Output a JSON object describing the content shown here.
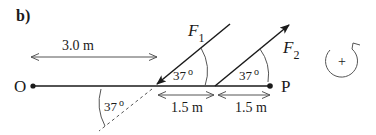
{
  "part_label": "b)",
  "points": {
    "origin": "O",
    "pivot": "P"
  },
  "forces": [
    {
      "name": "F",
      "subscript": "1",
      "angle_label": "37",
      "degree": "o"
    },
    {
      "name": "F",
      "subscript": "2",
      "angle_label": "37",
      "degree": "o"
    }
  ],
  "extension_angle": {
    "label": "37",
    "degree": "o"
  },
  "distances": {
    "o_to_f1": "3.0 m",
    "f1_to_f2": "1.5 m",
    "f2_to_p": "1.5 m"
  },
  "sign_convention": {
    "symbol": "+",
    "direction": "counterclockwise"
  },
  "colors": {
    "ink": "#1a1a1a",
    "dim": "#555555"
  }
}
